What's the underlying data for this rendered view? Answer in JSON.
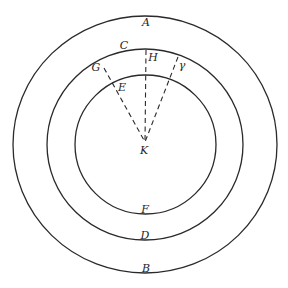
{
  "diagram": {
    "type": "concentric-circles-with-radial-rays",
    "colors": {
      "stroke": "#2a2a2a",
      "text": "#1e1e1e",
      "background": "#ffffff"
    },
    "circles": [
      {
        "id": "outer",
        "top_label": "A",
        "bottom_label": "B"
      },
      {
        "id": "middle",
        "top_label": "C",
        "bottom_label": "D"
      },
      {
        "id": "inner",
        "top_label": "",
        "bottom_label": "F"
      }
    ],
    "center_label": "K",
    "rays": [
      {
        "id": "left-ray",
        "outer_label": "G",
        "inner_label": "E",
        "style": "dashed"
      },
      {
        "id": "vertical-ray",
        "outer_label": "H",
        "inner_label": "",
        "style": "dashed"
      },
      {
        "id": "right-ray",
        "outer_label": "γ",
        "inner_label": "",
        "style": "dashed"
      }
    ]
  }
}
